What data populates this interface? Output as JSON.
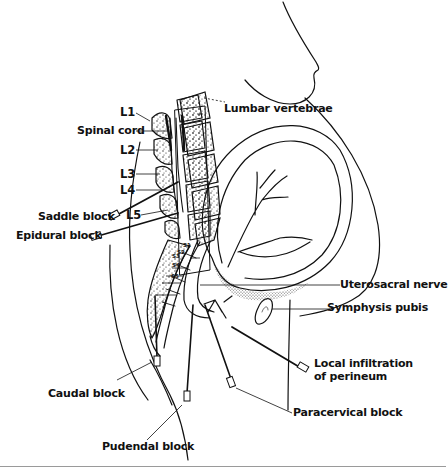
{
  "figure": {
    "type": "anatomical-diagram"
  },
  "labels": {
    "l1": "L1",
    "spinal_cord": "Spinal cord",
    "l2": "L2",
    "l3": "L3",
    "l4": "L4",
    "l5": "L5",
    "saddle_block": "Saddle block",
    "epidural_block": "Epidural block",
    "lumbar_vertebrae": "Lumbar vertebrae",
    "s1": "S1",
    "s2": "S2",
    "s3": "S3",
    "s4": "S4",
    "s5": "S5",
    "uterosacral_nerve": "Uterosacral nerve",
    "symphysis_pubis": "Symphysis pubis",
    "local_infiltration_line1": "Local infiltration",
    "local_infiltration_line2": "of perineum",
    "paracervical_block": "Paracervical block",
    "caudal_block": "Caudal block",
    "pudendal_block": "Pudendal block"
  },
  "colors": {
    "ink": "#111111",
    "background": "#ffffff",
    "rule": "#9a9a9a"
  }
}
